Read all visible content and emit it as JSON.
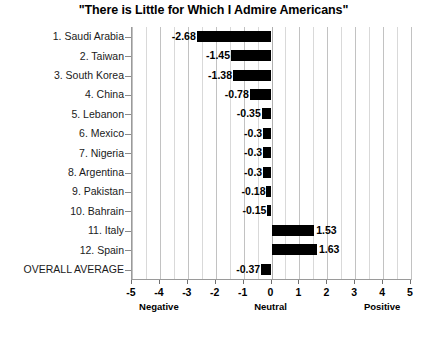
{
  "chart_data": {
    "type": "bar",
    "orientation": "horizontal",
    "title": "\"There is Little for Which I Admire Americans\"",
    "xlabel": "",
    "ylabel": "",
    "xlim": [
      -5,
      5
    ],
    "grid": true,
    "legend": null,
    "xticks": [
      -5,
      -4,
      -3,
      -2,
      -1,
      0,
      1,
      2,
      3,
      4,
      5
    ],
    "xtick_labels": [
      "-5",
      "-4",
      "-3",
      "-2",
      "-1",
      "0",
      "1",
      "2",
      "3",
      "4",
      "5"
    ],
    "annotations": [
      {
        "text": "Negative",
        "x": -4
      },
      {
        "text": "Neutral",
        "x": 0
      },
      {
        "text": "Positive",
        "x": 4
      }
    ],
    "categories": [
      "1. Saudi Arabia",
      "2. Taiwan",
      "3. South Korea",
      "4. China",
      "5. Lebanon",
      "6. Mexico",
      "7. Nigeria",
      "8. Argentina",
      "9. Pakistan",
      "10. Bahrain",
      "11. Italy",
      "12. Spain",
      "OVERALL AVERAGE"
    ],
    "values": [
      -2.68,
      -1.45,
      -1.38,
      -0.78,
      -0.35,
      -0.3,
      -0.3,
      -0.3,
      -0.18,
      -0.15,
      1.53,
      1.63,
      -0.37
    ],
    "value_labels": [
      "-2.68",
      "-1.45",
      "-1.38",
      "-0.78",
      "-0.35",
      "-0.3",
      "-0.3",
      "-0.3",
      "-0.18",
      "-0.15",
      "1.53",
      "1.63",
      "-0.37"
    ],
    "bar_color": "#000000",
    "background_color": "#ffffff",
    "gridline_color": "#d9d9d9"
  }
}
